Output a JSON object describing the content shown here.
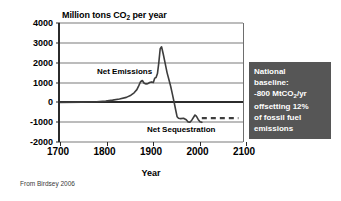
{
  "figure": {
    "source_caption": "From Birdsey 2006"
  },
  "callout": {
    "lines": [
      "National",
      "baseline:",
      "-800 MtCO2/yr",
      "offsetting 12%",
      "of fossil fuel",
      "emissions"
    ],
    "background_color": "#565656",
    "text_color": "#ffffff"
  },
  "chart_data": {
    "type": "line",
    "title": "Million tons CO2 per year",
    "title_parts": {
      "pre": "Million tons CO",
      "sub": "2",
      "post": " per year"
    },
    "xlabel": "Year",
    "ylabel": "",
    "xlim": [
      1700,
      2100
    ],
    "ylim": [
      -2000,
      4000
    ],
    "xticks": [
      1700,
      1800,
      1900,
      2000,
      2100
    ],
    "yticks": [
      4000,
      3000,
      2000,
      1000,
      0,
      -1000,
      -2000
    ],
    "grid": true,
    "zero_line": 0,
    "legend": "none",
    "annotations": [
      {
        "text": "Net Emissions",
        "x": 1795,
        "y": 1500
      },
      {
        "text": "Net Sequestration",
        "x": 1945,
        "y": -1500
      }
    ],
    "series": [
      {
        "name": "Net carbon flux",
        "style": "solid",
        "color": "#3d3d3d",
        "x": [
          1700,
          1750,
          1780,
          1800,
          1815,
          1830,
          1845,
          1855,
          1862,
          1868,
          1872,
          1876,
          1880,
          1884,
          1888,
          1892,
          1896,
          1900,
          1904,
          1907,
          1910,
          1913,
          1916,
          1919,
          1922,
          1926,
          1930,
          1934,
          1938,
          1942,
          1946,
          1950,
          1953,
          1956,
          1959,
          1964,
          1970,
          1976,
          1980,
          1984,
          1988,
          1992,
          1995,
          1998,
          2002,
          2006,
          2010
        ],
        "y": [
          0,
          10,
          30,
          60,
          110,
          170,
          250,
          360,
          480,
          640,
          830,
          1040,
          1100,
          960,
          930,
          940,
          1000,
          1030,
          1000,
          1220,
          1250,
          1450,
          2000,
          2700,
          2800,
          2400,
          1950,
          1500,
          1150,
          800,
          380,
          -60,
          -400,
          -730,
          -800,
          -820,
          -800,
          -880,
          -990,
          -1000,
          -900,
          -750,
          -640,
          -700,
          -860,
          -980,
          -1010
        ]
      },
      {
        "name": "Projected national baseline",
        "style": "dashed",
        "color": "#3d3d3d",
        "value": -800,
        "x": [
          2010,
          2090
        ],
        "y": [
          -800,
          -800
        ]
      }
    ]
  }
}
